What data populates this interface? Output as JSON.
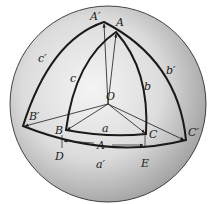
{
  "diagram": {
    "type": "spherical-triangle-polar",
    "center_label": "O",
    "inner_triangle": {
      "vertices": [
        "A",
        "B",
        "C"
      ],
      "sides": [
        "a",
        "b",
        "c"
      ]
    },
    "polar_triangle": {
      "vertices": [
        "A'",
        "B'",
        "C'"
      ],
      "sides": [
        "a'",
        "b'",
        "c'"
      ]
    },
    "equator_points": [
      "D",
      "E"
    ],
    "angle_marker_label": "A"
  },
  "labels": {
    "O": "O",
    "A": "A",
    "B": "B",
    "C": "C",
    "a": "a",
    "b": "b",
    "c": "c",
    "A_prime": "A′",
    "B_prime": "B′",
    "C_prime": "C′",
    "a_prime": "a′",
    "b_prime": "b′",
    "c_prime": "c′",
    "D": "D",
    "E": "E",
    "A_measure": "A",
    "corner_mark": "H"
  },
  "colors": {
    "sphere_light": "#f2f2f2",
    "sphere_dark": "#9a9a9a",
    "stroke": "#1a1a1a"
  }
}
